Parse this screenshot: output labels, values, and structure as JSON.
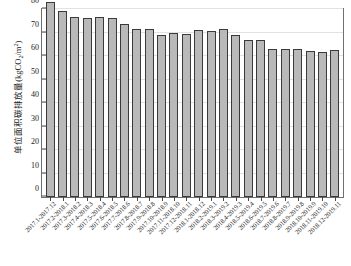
{
  "chart_data": {
    "type": "bar",
    "title": "",
    "xlabel": "",
    "ylabel": "单位面积碳排放量(kgCO2/m2)",
    "ylabel_parts": {
      "prefix": "单位面积碳排放量(kgCO",
      "sub": "2",
      "mid": "/m",
      "sup": "2",
      "suffix": ")"
    },
    "ylim": [
      0,
      80
    ],
    "yticks": [
      0,
      10,
      20,
      30,
      40,
      50,
      60,
      70,
      80
    ],
    "grid": true,
    "legend": "none",
    "categories": [
      "2017.1-2017.12",
      "2017.2-2018.1",
      "2017.3-2018.2",
      "2017.4-2018.3",
      "2017.5-2018.4",
      "2017.6-2018.5",
      "2017.7-2018.6",
      "2017.8-2018.7",
      "2017.9-2018.8",
      "2017.10-2018.9",
      "2017.11-2018.10",
      "2017.12-2018.11",
      "2018.1-2018.12",
      "2018.2-2019.1",
      "2018.3-2019.2",
      "2018.4-2019.3",
      "2018.5-2019.4",
      "2018.6-2019.5",
      "2018.7-2019.6",
      "2018.8-2019.7",
      "2018.9-2019.8",
      "2018.10-2019.9",
      "2018.11-2019.10",
      "2018.12-2019.11"
    ],
    "values": [
      83.0,
      79.0,
      76.5,
      76.0,
      76.5,
      76.0,
      73.5,
      71.5,
      71.5,
      69.0,
      70.0,
      69.5,
      71.0,
      70.5,
      71.5,
      69.0,
      67.0,
      67.0,
      63.0,
      63.0,
      63.0,
      62.0,
      61.5,
      62.5
    ],
    "colors": {
      "bar_fill": "#b9b9b9",
      "bar_edge": "#3a3a3a",
      "frame": "#707070",
      "grid": "#e2e2e2",
      "text": "#1a1a1a",
      "background": "#ffffff"
    }
  }
}
